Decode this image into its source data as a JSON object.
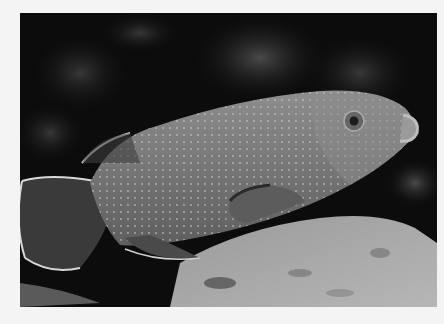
{
  "image": {
    "subject": "spotted grouper fish swimming over coral reef",
    "style": "grayscale photograph",
    "border_color": "#f4f4f4",
    "background_color": "#0c0c0c",
    "fish_color": "#7a7a7a",
    "rock_color": "#a8a8a8"
  }
}
